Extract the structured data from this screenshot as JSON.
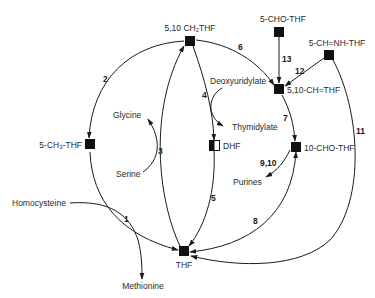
{
  "diagram": {
    "type": "metabolic-pathway",
    "nodes": {
      "ch2thf": {
        "label": "5,10 CH₂THF",
        "fill": "solid"
      },
      "cho_thf_5": {
        "label": "5-CHO-THF",
        "fill": "solid"
      },
      "chnh_thf": {
        "label": "5-CH=NH-THF",
        "fill": "solid"
      },
      "ch_thf": {
        "label": "5,10-CH=THF",
        "fill": "solid"
      },
      "cho_thf_10": {
        "label": "10-CHO-THF",
        "fill": "solid"
      },
      "dhf": {
        "label": "DHF",
        "fill": "half"
      },
      "ch3_thf": {
        "label": "5-CH₃-THF",
        "fill": "solid"
      },
      "thf": {
        "label": "THF",
        "fill": "solid"
      }
    },
    "metabolites": {
      "glycine": "Glycine",
      "serine": "Serine",
      "homocysteine": "Homocysteine",
      "methionine": "Methionine",
      "deoxyuridylate": "Deoxyuridylate",
      "thymidylate": "Thymidylate",
      "purines": "Purines"
    },
    "reactions": {
      "r1": "1",
      "r2": "2",
      "r3": "3",
      "r4": "4",
      "r5": "5",
      "r6": "6",
      "r7": "7",
      "r8": "8",
      "r9_10": "9,10",
      "r11": "11",
      "r12": "12",
      "r13": "13"
    },
    "edges": [
      {
        "reaction": "1",
        "from": "5-CH₃-THF",
        "to": "THF"
      },
      {
        "reaction": "1",
        "from": "Homocysteine",
        "to": "Methionine"
      },
      {
        "reaction": "2",
        "from": "5,10 CH₂THF",
        "to": "5-CH₃-THF"
      },
      {
        "reaction": "3",
        "from": "THF",
        "to": "5,10 CH₂THF"
      },
      {
        "reaction": "3",
        "from": "Serine",
        "to": "Glycine"
      },
      {
        "reaction": "4",
        "from": "5,10 CH₂THF",
        "to": "DHF"
      },
      {
        "reaction": "4",
        "from": "Deoxyuridylate",
        "to": "Thymidylate"
      },
      {
        "reaction": "5",
        "from": "DHF",
        "to": "THF"
      },
      {
        "reaction": "6",
        "from": "5,10 CH₂THF",
        "to": "5,10-CH=THF"
      },
      {
        "reaction": "7",
        "from": "5,10-CH=THF",
        "to": "10-CHO-THF"
      },
      {
        "reaction": "8",
        "from": "THF",
        "to": "10-CHO-THF"
      },
      {
        "reaction": "8",
        "from": "10-CHO-THF",
        "to": "THF"
      },
      {
        "reaction": "9,10",
        "from": "10-CHO-THF",
        "to": "Purines"
      },
      {
        "reaction": "11",
        "from": "5-CH=NH-THF",
        "to": "THF"
      },
      {
        "reaction": "12",
        "from": "5-CH=NH-THF",
        "to": "5,10-CH=THF"
      },
      {
        "reaction": "13",
        "from": "5-CHO-THF",
        "to": "5,10-CH=THF"
      }
    ],
    "colors": {
      "ink": "#1a1a1a",
      "background": "#ffffff"
    }
  }
}
